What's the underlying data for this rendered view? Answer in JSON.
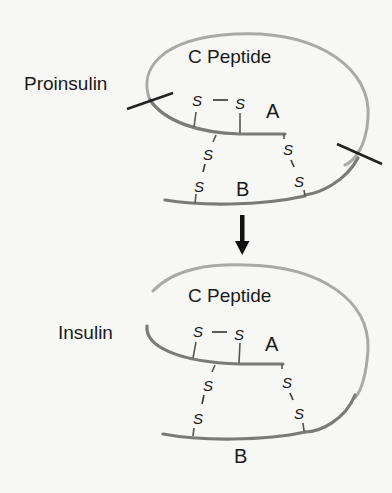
{
  "figure": {
    "top_panel": {
      "name_label": "Proinsulin",
      "c_peptide_label": "C Peptide",
      "chain_a_label": "A",
      "chain_b_label": "B",
      "sulfur_label": "S",
      "cleavage_sites": 2
    },
    "arrow": {
      "direction": "down",
      "icon": "arrow-down-icon"
    },
    "bottom_panel": {
      "name_label": "Insulin",
      "c_peptide_label": "C Peptide",
      "chain_a_label": "A",
      "chain_b_label": "B",
      "sulfur_label": "S"
    },
    "colors": {
      "background": "#f7f7f5",
      "c_peptide_loop": "#a9a9a9",
      "chains": "#7a7a7a",
      "text": "#1a1a1a",
      "cut_marks": "#222222"
    }
  }
}
